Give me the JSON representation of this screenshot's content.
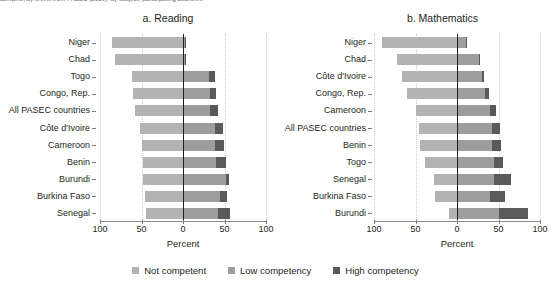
{
  "caption": "competency levels from PASEC (2019), by subject, participating countries",
  "axis": {
    "xlabel": "Percent",
    "ticks": [
      "100",
      "50",
      "0",
      "50",
      "100"
    ],
    "tick_values": [
      -100,
      -50,
      0,
      50,
      100
    ],
    "xlim": [
      -100,
      100
    ]
  },
  "legend": {
    "items": [
      {
        "label": "Not competent",
        "color": "#b3b3b3",
        "swatch": "square-swatch"
      },
      {
        "label": "Low competency",
        "color": "#9d9d9d",
        "swatch": "square-swatch"
      },
      {
        "label": "High competency",
        "color": "#5a5a5a",
        "swatch": "square-swatch"
      }
    ]
  },
  "chart_data": [
    {
      "type": "bar",
      "title": "a. Reading",
      "xlabel": "Percent",
      "ylabel": "",
      "xlim": [
        -100,
        100
      ],
      "grid": true,
      "orientation": "horizontal",
      "stacked": "diverging",
      "legend_position": "bottom",
      "categories": [
        "Niger",
        "Chad",
        "Togo",
        "Congo, Rep.",
        "All PASEC countries",
        "Côte d'Ivoire",
        "Cameroon",
        "Benin",
        "Burundi",
        "Burkina Faso",
        "Senegal"
      ],
      "series": [
        {
          "name": "Not competent",
          "values": [
            86,
            82,
            62,
            60,
            58,
            52,
            50,
            48,
            48,
            46,
            44
          ]
        },
        {
          "name": "Low competency",
          "values": [
            2,
            2,
            31,
            32,
            32,
            38,
            38,
            40,
            52,
            44,
            42
          ]
        },
        {
          "name": "High competency",
          "values": [
            1,
            2,
            7,
            8,
            10,
            10,
            12,
            12,
            3,
            9,
            15
          ]
        }
      ]
    },
    {
      "type": "bar",
      "title": "b. Mathematics",
      "xlabel": "Percent",
      "ylabel": "",
      "xlim": [
        -100,
        100
      ],
      "grid": true,
      "orientation": "horizontal",
      "stacked": "diverging",
      "legend_position": "bottom",
      "categories": [
        "Niger",
        "Chad",
        "Côte d'Ivoire",
        "Congo, Rep.",
        "Cameroon",
        "All PASEC countries",
        "Benin",
        "Togo",
        "Senegal",
        "Burkina Faso",
        "Burundi"
      ],
      "series": [
        {
          "name": "Not competent",
          "values": [
            90,
            72,
            66,
            60,
            50,
            46,
            44,
            38,
            28,
            26,
            10
          ]
        },
        {
          "name": "Low competency",
          "values": [
            11,
            26,
            30,
            34,
            40,
            42,
            42,
            45,
            45,
            40,
            50
          ]
        },
        {
          "name": "High competency",
          "values": [
            1,
            2,
            3,
            4,
            7,
            10,
            11,
            11,
            20,
            18,
            36
          ]
        }
      ]
    }
  ]
}
